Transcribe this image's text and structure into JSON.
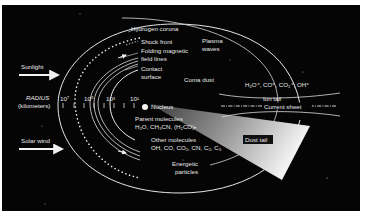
{
  "diagram": {
    "background_color": "#050505",
    "line_color": "#e8e8e8",
    "labels": {
      "hydrogen_corona": "Hydrogen corona",
      "shock_front": "Shock front",
      "folding_field_lines_1": "Folding magnetic",
      "folding_field_lines_2": "field lines",
      "contact_surface_1": "Contact",
      "contact_surface_2": "surface",
      "plasma_waves_1": "Plasma",
      "plasma_waves_2": "waves",
      "coma_dust": "Coma dust",
      "sunlight": "Sunlight",
      "solar_wind": "Solar wind",
      "radius_1": "RADIUS",
      "radius_2": "(kilometers)",
      "nucleus": "Nucleus",
      "parent_molecules_title": "Parent molecules",
      "parent_molecules_list": "H₂O, CH₃CN, (H₂CO)ₙ",
      "other_molecules_title": "Other molecules",
      "other_molecules_list": "OH, CO, CO₂, CN, C₂, C₃",
      "energetic_particles_1": "Energetic",
      "energetic_particles_2": "particles",
      "ions": "H₂O⁺, CO⁺, CO₂⁺, OH⁺",
      "ion_tail": "Ion tail",
      "current_sheet": "Current sheet",
      "dust_tail": "Dust tail"
    },
    "radius_scale": {
      "ticks": [
        "10⁷",
        "10⁵",
        "10³",
        "10¹"
      ]
    }
  }
}
